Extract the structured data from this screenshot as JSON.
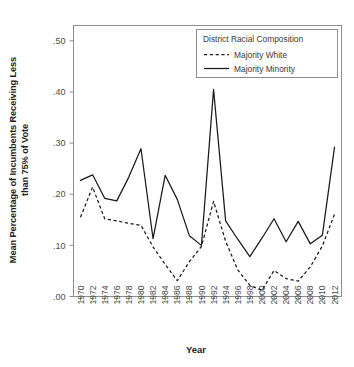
{
  "chart_data": {
    "type": "line",
    "title": "",
    "xlabel": "Year",
    "ylabel_line1": "Mean Percentage of Incumbents Receiving Less",
    "ylabel_line2": "than 75% of Vote",
    "ylabel": "Mean Percentage of Incumbents Receiving Less than 75% of Vote",
    "x": [
      1970,
      1972,
      1974,
      1976,
      1978,
      1980,
      1982,
      1984,
      1986,
      1988,
      1990,
      1992,
      1994,
      1996,
      1998,
      2000,
      2002,
      2004,
      2006,
      2008,
      2010,
      2012
    ],
    "categories": [
      "1970",
      "1972",
      "1974",
      "1976",
      "1978",
      "1980",
      "1982",
      "1984",
      "1986",
      "1988",
      "1990",
      "1992",
      "1994",
      "1996",
      "1998",
      "2000",
      "2002",
      "2004",
      "2006",
      "2008",
      "2010",
      "2012"
    ],
    "xtick_labels": [
      "1970",
      "1972",
      "1974",
      "1976",
      "1978",
      "1980",
      "1982",
      "1984",
      "1986",
      "1988",
      "1990",
      "1992",
      "1994",
      "1996",
      "1998",
      "2000",
      "2002",
      "2004",
      "2006",
      "2008",
      "2010",
      "2012"
    ],
    "ytick_labels": [
      ".50",
      ".40",
      ".30",
      ".20",
      ".10",
      ".00"
    ],
    "ytick_values": [
      0.5,
      0.4,
      0.3,
      0.2,
      0.1,
      0.0
    ],
    "ylim": [
      0.0,
      0.53
    ],
    "xlim": [
      1969,
      2013
    ],
    "grid": false,
    "legend_position": "top-right",
    "legend_title": "District Racial Composition",
    "series": [
      {
        "name": "Majority White",
        "style": "dashed",
        "color": "#1a1a1a",
        "values": [
          0.155,
          0.214,
          0.152,
          0.148,
          0.143,
          0.139,
          0.097,
          0.063,
          0.031,
          0.068,
          0.098,
          0.186,
          0.108,
          0.052,
          0.022,
          0.012,
          0.051,
          0.035,
          0.03,
          0.058,
          0.099,
          0.161
        ]
      },
      {
        "name": "Majority Minority",
        "style": "solid",
        "color": "#1a1a1a",
        "values": [
          0.227,
          0.238,
          0.192,
          0.187,
          0.234,
          0.289,
          0.113,
          0.237,
          0.19,
          0.119,
          0.1,
          0.405,
          0.148,
          0.112,
          0.078,
          0.114,
          0.152,
          0.107,
          0.147,
          0.103,
          0.12,
          0.292
        ]
      }
    ]
  },
  "axes": {
    "y_axis_name": "y-axis",
    "x_axis_name": "x-axis"
  }
}
